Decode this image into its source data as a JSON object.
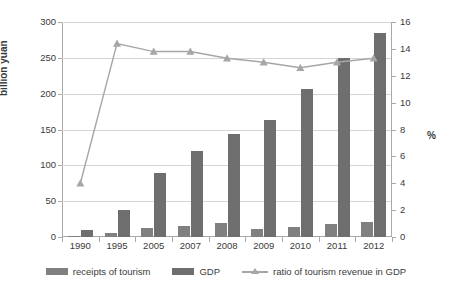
{
  "chart_data": {
    "type": "bar",
    "title": "",
    "subtitle": "",
    "xlabel": "",
    "ylabel": "billion yuan",
    "y2label": "%",
    "categories": [
      "1990",
      "1995",
      "2005",
      "2007",
      "2008",
      "2009",
      "2010",
      "2011",
      "2012"
    ],
    "ylim": [
      0,
      300
    ],
    "y2lim": [
      0,
      16
    ],
    "yticks": [
      "0",
      "50",
      "100",
      "150",
      "200",
      "250",
      "300"
    ],
    "y2ticks": [
      "0",
      "2",
      "4",
      "6",
      "8",
      "10",
      "12",
      "14",
      "16"
    ],
    "grid": true,
    "legend_position": "bottom",
    "series": [
      {
        "name": "receipts of tourism",
        "type": "bar",
        "axis": "left",
        "color": "#808080",
        "values": [
          1,
          5,
          12,
          16,
          19,
          11,
          14,
          18,
          21
        ]
      },
      {
        "name": "GDP",
        "type": "bar",
        "axis": "left",
        "color": "#6e6e6e",
        "values": [
          10,
          37,
          89,
          120,
          144,
          163,
          206,
          250,
          284
        ]
      },
      {
        "name": "ratio of tourism revenue in GDP",
        "type": "line",
        "axis": "right",
        "color": "#a6a6a6",
        "marker": "triangle",
        "values": [
          4.0,
          14.4,
          13.8,
          13.8,
          13.3,
          13.0,
          12.6,
          13.0,
          13.3
        ]
      }
    ]
  },
  "legend": {
    "items": [
      {
        "label": "receipts of tourism",
        "icon": "bar-swatch-icon"
      },
      {
        "label": "GDP",
        "icon": "bar-swatch-icon"
      },
      {
        "label": "ratio of tourism revenue in GDP",
        "icon": "line-marker-swatch-icon"
      }
    ]
  },
  "axes": {
    "left_title": "billion yuan",
    "right_title": "%"
  }
}
